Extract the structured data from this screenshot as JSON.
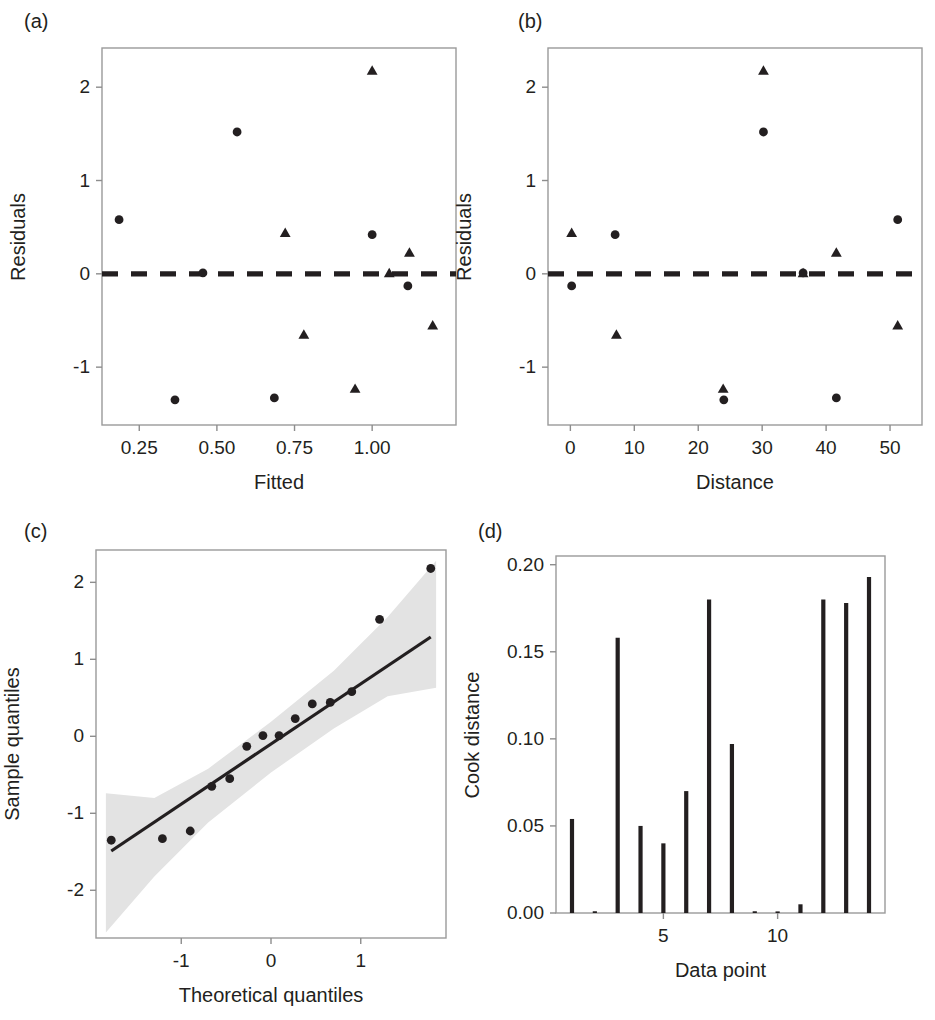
{
  "figure": {
    "background": "#ffffff",
    "ink": "#231f20",
    "band_color": "#e3e3e3"
  },
  "panels": [
    {
      "tag": "(a)",
      "name": "residuals-vs-fitted"
    },
    {
      "tag": "(b)",
      "name": "residuals-vs-distance"
    },
    {
      "tag": "(c)",
      "name": "normal-qq-plot"
    },
    {
      "tag": "(d)",
      "name": "cook-distance-plot"
    }
  ],
  "chart_data": [
    {
      "panel": "(a)",
      "type": "scatter",
      "title": "",
      "xlabel": "Fitted",
      "ylabel": "Residuals",
      "xlim": [
        0.13,
        1.27
      ],
      "ylim": [
        -1.62,
        2.42
      ],
      "xticks": [
        0.25,
        0.5,
        0.75,
        1.0
      ],
      "xticklabels": [
        "0.25",
        "0.50",
        "0.75",
        "1.00"
      ],
      "yticks": [
        -1,
        0,
        1,
        2
      ],
      "yticklabels": [
        "-1",
        "0",
        "1",
        "2"
      ],
      "grid": false,
      "reference_line": {
        "y": 0,
        "style": "dashed"
      },
      "series": [
        {
          "name": "circles",
          "marker": "circle",
          "points": [
            {
              "x": 0.185,
              "y": 0.58
            },
            {
              "x": 0.365,
              "y": -1.35
            },
            {
              "x": 0.455,
              "y": 0.01
            },
            {
              "x": 0.565,
              "y": 1.52
            },
            {
              "x": 0.685,
              "y": -1.33
            },
            {
              "x": 1.0,
              "y": 0.42
            },
            {
              "x": 1.115,
              "y": -0.13
            }
          ]
        },
        {
          "name": "triangles",
          "marker": "triangle",
          "points": [
            {
              "x": 0.72,
              "y": 0.44
            },
            {
              "x": 0.78,
              "y": -0.65
            },
            {
              "x": 0.945,
              "y": -1.23
            },
            {
              "x": 1.0,
              "y": 2.18
            },
            {
              "x": 1.055,
              "y": 0.01
            },
            {
              "x": 1.12,
              "y": 0.23
            },
            {
              "x": 1.195,
              "y": -0.55
            }
          ]
        }
      ]
    },
    {
      "panel": "(b)",
      "type": "scatter",
      "title": "",
      "xlabel": "Distance",
      "ylabel": "Residuals",
      "xlim": [
        -3.5,
        55
      ],
      "ylim": [
        -1.62,
        2.42
      ],
      "xticks": [
        0,
        10,
        20,
        30,
        40,
        50
      ],
      "xticklabels": [
        "0",
        "10",
        "20",
        "30",
        "40",
        "50"
      ],
      "yticks": [
        -1,
        0,
        1,
        2
      ],
      "yticklabels": [
        "-1",
        "0",
        "1",
        "2"
      ],
      "grid": false,
      "reference_line": {
        "y": 0,
        "style": "dashed"
      },
      "series": [
        {
          "name": "circles",
          "marker": "circle",
          "points": [
            {
              "x": 0.2,
              "y": -0.13
            },
            {
              "x": 7.0,
              "y": 0.42
            },
            {
              "x": 24.0,
              "y": -1.35
            },
            {
              "x": 30.2,
              "y": 1.52
            },
            {
              "x": 36.4,
              "y": 0.01
            },
            {
              "x": 41.6,
              "y": -1.33
            },
            {
              "x": 51.2,
              "y": 0.58
            }
          ]
        },
        {
          "name": "triangles",
          "marker": "triangle",
          "points": [
            {
              "x": 0.2,
              "y": 0.44
            },
            {
              "x": 7.2,
              "y": -0.65
            },
            {
              "x": 23.9,
              "y": -1.23
            },
            {
              "x": 30.2,
              "y": 2.18
            },
            {
              "x": 36.4,
              "y": 0.01
            },
            {
              "x": 41.6,
              "y": 0.23
            },
            {
              "x": 51.2,
              "y": -0.55
            }
          ]
        }
      ]
    },
    {
      "panel": "(c)",
      "type": "scatter",
      "title": "",
      "xlabel": "Theoretical quantiles",
      "ylabel": "Sample quantiles",
      "xlim": [
        -1.95,
        1.95
      ],
      "ylim": [
        -2.62,
        2.42
      ],
      "xticks": [
        -1,
        0,
        1
      ],
      "xticklabels": [
        "-1",
        "0",
        "1"
      ],
      "yticks": [
        -2,
        -1,
        0,
        1,
        2
      ],
      "yticklabels": [
        "-2",
        "-1",
        "0",
        "1",
        "2"
      ],
      "grid": false,
      "fit_line": {
        "x": [
          -1.78,
          1.78
        ],
        "y": [
          -1.49,
          1.29
        ]
      },
      "confidence_band": {
        "label": "pointwise confidence band",
        "color": "#e3e3e3",
        "upper": [
          {
            "x": -1.84,
            "y": -0.74
          },
          {
            "x": -1.3,
            "y": -0.8
          },
          {
            "x": -0.7,
            "y": -0.42
          },
          {
            "x": 0.0,
            "y": 0.19
          },
          {
            "x": 0.7,
            "y": 0.85
          },
          {
            "x": 1.3,
            "y": 1.55
          },
          {
            "x": 1.84,
            "y": 2.28
          }
        ],
        "lower": [
          {
            "x": -1.84,
            "y": -2.55
          },
          {
            "x": -1.3,
            "y": -1.82
          },
          {
            "x": -0.7,
            "y": -1.12
          },
          {
            "x": 0.0,
            "y": -0.47
          },
          {
            "x": 0.7,
            "y": 0.1
          },
          {
            "x": 1.3,
            "y": 0.52
          },
          {
            "x": 1.84,
            "y": 0.63
          }
        ]
      },
      "series": [
        {
          "name": "sample-quantiles",
          "marker": "circle",
          "points": [
            {
              "x": -1.78,
              "y": -1.35
            },
            {
              "x": -1.21,
              "y": -1.33
            },
            {
              "x": -0.9,
              "y": -1.23
            },
            {
              "x": -0.66,
              "y": -0.65
            },
            {
              "x": -0.46,
              "y": -0.55
            },
            {
              "x": -0.27,
              "y": -0.13
            },
            {
              "x": -0.09,
              "y": 0.01
            },
            {
              "x": 0.09,
              "y": 0.01
            },
            {
              "x": 0.27,
              "y": 0.23
            },
            {
              "x": 0.46,
              "y": 0.42
            },
            {
              "x": 0.66,
              "y": 0.44
            },
            {
              "x": 0.9,
              "y": 0.58
            },
            {
              "x": 1.21,
              "y": 1.52
            },
            {
              "x": 1.78,
              "y": 2.18
            }
          ]
        }
      ]
    },
    {
      "panel": "(d)",
      "type": "bar",
      "title": "",
      "xlabel": "Data point",
      "ylabel": "Cook distance",
      "xlim": [
        0.3,
        14.7
      ],
      "ylim": [
        0,
        0.205
      ],
      "xticks": [
        5,
        10
      ],
      "xticklabels": [
        "5",
        "10"
      ],
      "yticks": [
        0.0,
        0.05,
        0.1,
        0.15,
        0.2
      ],
      "yticklabels": [
        "0.00",
        "0.05",
        "0.10",
        "0.15",
        "0.20"
      ],
      "grid": false,
      "categories": [
        1,
        2,
        3,
        4,
        5,
        6,
        7,
        8,
        9,
        10,
        11,
        12,
        13,
        14
      ],
      "values": [
        0.054,
        0.001,
        0.158,
        0.05,
        0.04,
        0.07,
        0.18,
        0.097,
        0.001,
        0.0,
        0.005,
        0.18,
        0.178,
        0.193
      ]
    }
  ]
}
